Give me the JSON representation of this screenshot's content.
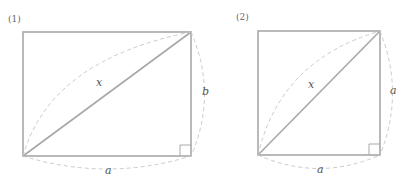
{
  "figures": [
    {
      "id": "1",
      "label": "(1)",
      "shape": "rectangle",
      "diagonal_label": "x",
      "bottom_label": "a",
      "side_label": "b",
      "right_angle": true
    },
    {
      "id": "2",
      "label": "(2)",
      "shape": "square",
      "diagonal_label": "x",
      "bottom_label": "a",
      "side_label": "a",
      "right_angle": true
    }
  ],
  "colors": {
    "line": "#a8a8a8",
    "dashed": "#c4c4c4",
    "text": "#555555"
  }
}
